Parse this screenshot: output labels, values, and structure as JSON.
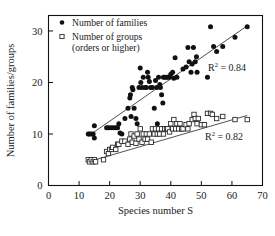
{
  "chart_data": {
    "type": "scatter",
    "title": "",
    "xlabel": "Species number S",
    "ylabel": "Number of families/groups",
    "xlim": [
      0,
      70
    ],
    "ylim": [
      0,
      33
    ],
    "xticks": [
      0,
      10,
      20,
      30,
      40,
      50,
      60,
      70
    ],
    "yticks": [
      0,
      10,
      20,
      30
    ],
    "grid": false,
    "legend_position": "top-left",
    "series": [
      {
        "name": "Number of families",
        "marker": "filled-circle",
        "color": "#111111",
        "trendline": {
          "x": [
            13,
            65
          ],
          "y": [
            9.6,
            31.0
          ],
          "r_squared": "0.84",
          "r_squared_label": "R",
          "r_squared_exponent": "2",
          "r_squared_value": "= 0.84"
        },
        "points": [
          [
            13,
            10.0
          ],
          [
            13.4,
            10.0
          ],
          [
            14,
            10.0
          ],
          [
            14.6,
            10.0
          ],
          [
            15,
            11.6
          ],
          [
            15,
            9.2
          ],
          [
            19,
            11.2
          ],
          [
            19.6,
            11.2
          ],
          [
            20.4,
            11.2
          ],
          [
            21.2,
            11.2
          ],
          [
            22,
            11.2
          ],
          [
            22.6,
            11.2
          ],
          [
            23,
            12.0
          ],
          [
            23.4,
            10.2
          ],
          [
            24,
            10.0
          ],
          [
            25,
            13.0
          ],
          [
            26,
            15.0
          ],
          [
            26.6,
            17.0
          ],
          [
            26.8,
            17.6
          ],
          [
            27,
            13.4
          ],
          [
            27.4,
            19.0
          ],
          [
            27.6,
            18.6
          ],
          [
            28,
            15.0
          ],
          [
            28.6,
            13.0
          ],
          [
            29,
            12.0
          ],
          [
            29.6,
            19.0
          ],
          [
            30,
            22.8
          ],
          [
            30.2,
            20.0
          ],
          [
            30.6,
            19.0
          ],
          [
            31,
            21.0
          ],
          [
            31.6,
            19.0
          ],
          [
            32,
            19.0
          ],
          [
            32.4,
            22.0
          ],
          [
            32.6,
            21.0
          ],
          [
            33,
            20.2
          ],
          [
            33.4,
            19.0
          ],
          [
            34,
            19.0
          ],
          [
            34.6,
            15.0
          ],
          [
            35,
            20.4
          ],
          [
            35.4,
            19.0
          ],
          [
            35.6,
            12.0
          ],
          [
            36,
            21.0
          ],
          [
            36.4,
            19.6
          ],
          [
            36.6,
            19.0
          ],
          [
            37,
            17.6
          ],
          [
            37.4,
            16.0
          ],
          [
            37.6,
            21.0
          ],
          [
            38,
            21.0
          ],
          [
            38.6,
            21.0
          ],
          [
            39,
            21.0
          ],
          [
            39.6,
            21.0
          ],
          [
            40,
            21.6
          ],
          [
            40.6,
            22.0
          ],
          [
            41,
            20.8
          ],
          [
            41.4,
            24.8
          ],
          [
            42,
            21.0
          ],
          [
            44,
            22.6
          ],
          [
            45,
            23.0
          ],
          [
            45.6,
            26.8
          ],
          [
            46,
            24.0
          ],
          [
            46.6,
            22.0
          ],
          [
            47,
            23.6
          ],
          [
            47.4,
            26.8
          ],
          [
            48,
            24.0
          ],
          [
            48.4,
            25.0
          ],
          [
            48.6,
            22.0
          ],
          [
            52,
            21.0
          ],
          [
            53,
            30.8
          ],
          [
            54,
            27.0
          ],
          [
            55,
            26.0
          ],
          [
            57,
            27.0
          ],
          [
            61,
            28.8
          ],
          [
            65,
            30.8
          ]
        ]
      },
      {
        "name": "Number of groups (orders or higher)",
        "marker": "open-square",
        "color": "#222222",
        "trendline": {
          "x": [
            13,
            65
          ],
          "y": [
            4.6,
            13.6
          ],
          "r_squared": "0.82",
          "r_squared_label": "R",
          "r_squared_exponent": "2",
          "r_squared_value": "= 0.82"
        },
        "points": [
          [
            13,
            5.0
          ],
          [
            13.4,
            4.6
          ],
          [
            14,
            5.0
          ],
          [
            14.6,
            4.6
          ],
          [
            15,
            5.0
          ],
          [
            15.4,
            4.6
          ],
          [
            18,
            5.0
          ],
          [
            19,
            6.6
          ],
          [
            19.6,
            6.2
          ],
          [
            20,
            7.0
          ],
          [
            20.6,
            7.0
          ],
          [
            21,
            7.4
          ],
          [
            22,
            7.0
          ],
          [
            22.6,
            8.0
          ],
          [
            23,
            8.0
          ],
          [
            24,
            8.6
          ],
          [
            25,
            8.6
          ],
          [
            26,
            8.0
          ],
          [
            26.6,
            9.0
          ],
          [
            27,
            10.0
          ],
          [
            27.4,
            8.4
          ],
          [
            28,
            9.6
          ],
          [
            28.6,
            8.2
          ],
          [
            29,
            10.0
          ],
          [
            29.6,
            9.0
          ],
          [
            30,
            11.0
          ],
          [
            30.6,
            8.4
          ],
          [
            31,
            10.0
          ],
          [
            31.6,
            9.0
          ],
          [
            32,
            10.0
          ],
          [
            32.4,
            9.0
          ],
          [
            33,
            10.0
          ],
          [
            33.6,
            8.4
          ],
          [
            34,
            11.0
          ],
          [
            34.6,
            10.0
          ],
          [
            35,
            11.0
          ],
          [
            35.6,
            10.0
          ],
          [
            36,
            11.0
          ],
          [
            36.4,
            10.0
          ],
          [
            37,
            11.0
          ],
          [
            37.6,
            10.0
          ],
          [
            38,
            11.0
          ],
          [
            38.6,
            11.0
          ],
          [
            39,
            11.0
          ],
          [
            39.6,
            10.4
          ],
          [
            40,
            12.0
          ],
          [
            40.6,
            11.0
          ],
          [
            41,
            12.8
          ],
          [
            41.6,
            11.0
          ],
          [
            42,
            12.0
          ],
          [
            42.6,
            11.0
          ],
          [
            43,
            12.0
          ],
          [
            43.6,
            11.0
          ],
          [
            44,
            11.0
          ],
          [
            45,
            11.8
          ],
          [
            45.6,
            11.0
          ],
          [
            46,
            12.0
          ],
          [
            47,
            12.8
          ],
          [
            47.6,
            13.8
          ],
          [
            48,
            13.0
          ],
          [
            48.6,
            12.0
          ],
          [
            49,
            13.0
          ],
          [
            50,
            11.8
          ],
          [
            51,
            11.8
          ],
          [
            52,
            14.0
          ],
          [
            53,
            14.0
          ],
          [
            53.6,
            13.8
          ],
          [
            55,
            13.0
          ],
          [
            57,
            13.4
          ],
          [
            61,
            12.8
          ],
          [
            65,
            12.8
          ]
        ]
      }
    ]
  },
  "legend": {
    "items": [
      {
        "label": "Number of families",
        "marker": "filled-circle"
      },
      {
        "label": "Number of groups",
        "marker": "open-square"
      }
    ],
    "continuation_line": "(orders or higher)"
  }
}
